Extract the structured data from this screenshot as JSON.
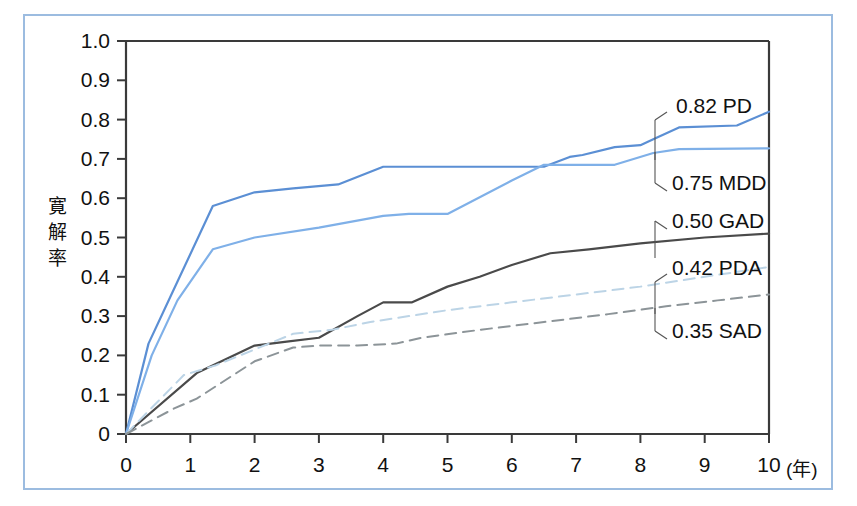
{
  "figure": {
    "frame_color": "#9cbce0",
    "background": "#ffffff"
  },
  "chart_data": {
    "type": "line",
    "title": "",
    "subtitle": "",
    "xlabel": "(年)",
    "ylabel": "寛解率",
    "ylabel_chars": [
      "寛",
      "解",
      "率"
    ],
    "xlim": [
      0,
      10
    ],
    "ylim": [
      0,
      1.0
    ],
    "grid": false,
    "legend_position": "inline-right-annotations",
    "x_tick_labels": [
      "0",
      "1",
      "2",
      "3",
      "4",
      "5",
      "6",
      "7",
      "8",
      "9",
      "10"
    ],
    "x_tick_values": [
      0,
      1,
      2,
      3,
      4,
      5,
      6,
      7,
      8,
      9,
      10
    ],
    "x_unit_label": "(年)",
    "y_tick_labels": [
      "0",
      "0.1",
      "0.2",
      "0.3",
      "0.4",
      "0.5",
      "0.6",
      "0.7",
      "0.8",
      "0.9",
      "1.0"
    ],
    "y_tick_values": [
      0,
      0.1,
      0.2,
      0.3,
      0.4,
      0.5,
      0.6,
      0.7,
      0.8,
      0.9,
      1.0
    ],
    "series": [
      {
        "name": "PD",
        "label": "0.82 PD",
        "final_value": 0.82,
        "color": "#5b8fd4",
        "style": "solid",
        "x": [
          0,
          0.35,
          0.75,
          1.35,
          2.0,
          2.6,
          3.3,
          4.0,
          4.2,
          6.5,
          6.9,
          7.1,
          7.6,
          8.0,
          8.2,
          8.6,
          9.5,
          10.0
        ],
        "y": [
          0.0,
          0.23,
          0.37,
          0.58,
          0.615,
          0.625,
          0.635,
          0.68,
          0.68,
          0.68,
          0.705,
          0.71,
          0.73,
          0.735,
          0.75,
          0.78,
          0.785,
          0.82
        ]
      },
      {
        "name": "MDD",
        "label": "0.75 MDD",
        "final_value": 0.75,
        "color": "#7fb0e8",
        "style": "solid",
        "x": [
          0,
          0.4,
          0.8,
          1.35,
          2.0,
          3.0,
          4.0,
          4.4,
          5.0,
          6.0,
          6.5,
          7.6,
          8.2,
          8.6,
          10.0
        ],
        "y": [
          0.0,
          0.2,
          0.34,
          0.47,
          0.5,
          0.525,
          0.555,
          0.56,
          0.56,
          0.645,
          0.685,
          0.685,
          0.715,
          0.725,
          0.727
        ]
      },
      {
        "name": "GAD",
        "label": "0.50 GAD",
        "final_value": 0.5,
        "color": "#4a4a4a",
        "style": "solid",
        "x": [
          0,
          1.1,
          1.55,
          2.0,
          2.5,
          3.0,
          3.6,
          4.0,
          4.45,
          5.0,
          5.5,
          6.0,
          6.6,
          7.2,
          8.0,
          9.0,
          10.0
        ],
        "y": [
          0.0,
          0.155,
          0.19,
          0.225,
          0.235,
          0.245,
          0.3,
          0.335,
          0.335,
          0.375,
          0.4,
          0.43,
          0.46,
          0.47,
          0.485,
          0.5,
          0.51
        ]
      },
      {
        "name": "PDA",
        "label": "0.42 PDA",
        "final_value": 0.42,
        "color": "#bcd4e6",
        "style": "dashed",
        "x": [
          0,
          0.9,
          1.4,
          2.0,
          2.6,
          3.2,
          3.8,
          4.4,
          5.0,
          6.0,
          7.0,
          8.0,
          9.0,
          10.0
        ],
        "y": [
          0.0,
          0.15,
          0.175,
          0.215,
          0.255,
          0.265,
          0.285,
          0.3,
          0.315,
          0.335,
          0.355,
          0.375,
          0.4,
          0.425
        ]
      },
      {
        "name": "SAD",
        "label": "0.35 SAD",
        "final_value": 0.35,
        "color": "#8c9498",
        "style": "dashed",
        "x": [
          0,
          0.75,
          1.1,
          2.0,
          2.6,
          3.0,
          3.6,
          4.2,
          4.6,
          5.5,
          6.5,
          7.5,
          8.4,
          9.2,
          10.0
        ],
        "y": [
          0.0,
          0.065,
          0.09,
          0.185,
          0.22,
          0.225,
          0.225,
          0.23,
          0.245,
          0.265,
          0.285,
          0.305,
          0.325,
          0.34,
          0.355
        ]
      }
    ],
    "annotations": [
      {
        "text": "0.82 PD",
        "value": 0.82,
        "series": "PD"
      },
      {
        "text": "0.75 MDD",
        "value": 0.75,
        "series": "MDD"
      },
      {
        "text": "0.50 GAD",
        "value": 0.5,
        "series": "GAD"
      },
      {
        "text": "0.42 PDA",
        "value": 0.42,
        "series": "PDA"
      },
      {
        "text": "0.35 SAD",
        "value": 0.35,
        "series": "SAD"
      }
    ]
  }
}
